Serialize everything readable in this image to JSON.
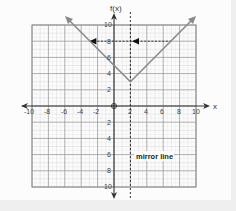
{
  "chart_data": {
    "type": "line",
    "title": "",
    "xlabel": "x",
    "ylabel": "f(x)",
    "xlim": [
      -10,
      10
    ],
    "ylim": [
      -10,
      10
    ],
    "grid": true,
    "x_ticks": [
      -10,
      -8,
      -6,
      -4,
      -2,
      2,
      4,
      6,
      8,
      10
    ],
    "y_ticks": [
      -10,
      -8,
      -6,
      -4,
      -2,
      2,
      4,
      6,
      8,
      10
    ],
    "origin_marker": true,
    "series": [
      {
        "name": "f(x) = |x - 2| + 3",
        "type": "absolute-value",
        "vertex": [
          2,
          3
        ],
        "points": [
          [
            -5.5,
            10.5
          ],
          [
            2,
            3
          ],
          [
            9.5,
            10.5
          ]
        ],
        "color": "#8a8a8a"
      }
    ],
    "annotations": [
      {
        "type": "vertical-dashed-line",
        "x": 2,
        "label": "mirror line"
      },
      {
        "type": "horizontal-dashed-arrow",
        "y": 8,
        "from_x": 7,
        "to_x": -3,
        "arrowheads_at_x": [
          2,
          -3
        ]
      }
    ]
  },
  "labels": {
    "y_axis": "f(x)",
    "x_axis": "x",
    "mirror_line": "mirror line",
    "x_ticks": [
      "-10",
      "-8",
      "-6",
      "-4",
      "-2",
      "2",
      "4",
      "6",
      "8",
      "10"
    ],
    "y_ticks_pos": [
      "10",
      "8",
      "6",
      "4",
      "2"
    ],
    "y_ticks_neg": [
      "2",
      "4",
      "6",
      "8",
      "10"
    ]
  },
  "colors": {
    "function_line": "#8a8a8a",
    "axes": "#333333",
    "grid_minor": "#dddddd",
    "grid_major": "#9a9a9a",
    "dashed": "#222222"
  }
}
